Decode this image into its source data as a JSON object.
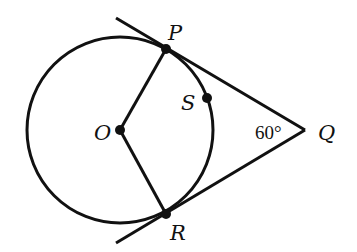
{
  "diagram": {
    "type": "geometry",
    "points": {
      "O": {
        "label": "O",
        "x": 120,
        "y": 130
      },
      "P": {
        "label": "P",
        "x": 166,
        "y": 48
      },
      "R": {
        "label": "R",
        "x": 166,
        "y": 214
      },
      "Q": {
        "label": "Q",
        "x": 305,
        "y": 130
      },
      "S": {
        "label": "S",
        "x": 207,
        "y": 98
      }
    },
    "circle": {
      "center": "O",
      "radius": 93
    },
    "segments": [
      "OP",
      "OR"
    ],
    "tangents": [
      "QP",
      "QR"
    ],
    "angle_label": "60°",
    "angle_at": "Q",
    "stroke_color": "#111111",
    "background": "#ffffff"
  }
}
